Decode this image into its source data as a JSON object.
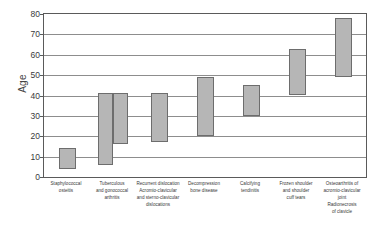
{
  "chart_data": {
    "type": "bar",
    "subtype": "floating-range-bar",
    "title": "",
    "xlabel": "",
    "ylabel": "Age",
    "ylim": [
      0,
      80
    ],
    "yticks": [
      0,
      10,
      20,
      30,
      40,
      50,
      60,
      70,
      80
    ],
    "grid": true,
    "legend": false,
    "categories": [
      "Staphylococcal\nosteitis",
      "Tuberculous\nand gonococcal\narthritis",
      "Recurrent dislocation\nAcromio-clavicular\nand sterno-clavicular\ndislocations",
      "Decompression\nbone disease",
      "Calcifying\ntendinitis",
      "Frozen shoulder\nand shoulder\ncuff tears",
      "Osteoarthritis of\nacromio-clavicular\njoint\nRadionecrosis\nof clavicle"
    ],
    "bars": [
      {
        "category": "Staphylococcal osteitis",
        "low": 4,
        "high": 14,
        "slot": 0
      },
      {
        "category": "Tuberculous and gonococcal arthritis",
        "low": 6,
        "high": 41,
        "slot": 0
      },
      {
        "category": "Tuberculous and gonococcal arthritis",
        "low": 16,
        "high": 41,
        "slot": 1
      },
      {
        "category": "Recurrent dislocation Acromio-clavicular and sterno-clavicular dislocations",
        "low": 17,
        "high": 41,
        "slot": 0
      },
      {
        "category": "Decompression bone disease",
        "low": 20,
        "high": 49,
        "slot": 0
      },
      {
        "category": "Calcifying tendinitis",
        "low": 30,
        "high": 45,
        "slot": 0
      },
      {
        "category": "Frozen shoulder and shoulder cuff tears",
        "low": 40,
        "high": 63,
        "slot": 0
      },
      {
        "category": "Osteoarthritis of acromio-clavicular joint Radionecrosis of clavicle",
        "low": 49,
        "high": 78,
        "slot": 0
      }
    ],
    "colors": {
      "bar_fill": "#b6b6b6",
      "bar_stroke": "#6d6d6d",
      "grid": "#8d8d8d",
      "axis": "#5a5a5a",
      "text": "#3a3a3a"
    }
  }
}
